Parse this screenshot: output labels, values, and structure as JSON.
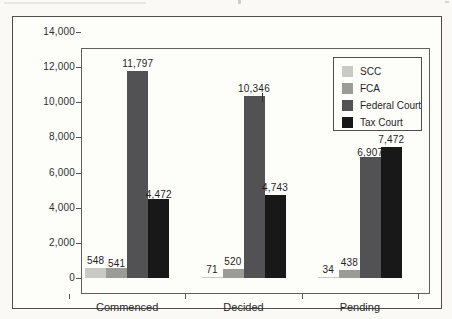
{
  "chart_data": {
    "type": "bar",
    "title": "",
    "categories": [
      "Commenced",
      "Decided",
      "Pending"
    ],
    "series": [
      {
        "name": "SCC",
        "color": "#c9c9c5",
        "values": [
          548,
          71,
          34
        ],
        "labels": [
          "548",
          "71",
          "34"
        ]
      },
      {
        "name": "FCA",
        "color": "#9b9b97",
        "values": [
          541,
          520,
          438
        ],
        "labels": [
          "541",
          "520",
          "438"
        ]
      },
      {
        "name": "Federal Court",
        "color": "#525254",
        "values": [
          11797,
          10346,
          6907
        ],
        "labels": [
          "11,797",
          "10,346",
          "6,907"
        ]
      },
      {
        "name": "Tax Court",
        "color": "#181818",
        "values": [
          4472,
          4743,
          7472
        ],
        "labels": [
          "4,472",
          "4,743",
          "7,472"
        ]
      }
    ],
    "ylim": [
      0,
      14000
    ],
    "ytick_step": 2000,
    "ytick_labels": [
      "0",
      "2,000",
      "4,000",
      "6,000",
      "8,000",
      "10,000",
      "12,000",
      "14,000"
    ],
    "grid": false,
    "legend": {
      "position": "top-right",
      "items": [
        "SCC",
        "FCA",
        "Federal Court",
        "Tax Court"
      ]
    }
  }
}
